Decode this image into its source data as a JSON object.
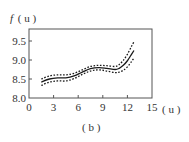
{
  "chart_data": {
    "type": "line",
    "title": "",
    "caption": "( b )",
    "ylabel_func": "f",
    "ylabel_arg": "( u )",
    "xlabel": "( u )",
    "xlim": [
      0,
      15
    ],
    "ylim": [
      8.0,
      9.75
    ],
    "xticks": [
      0,
      3,
      6,
      9,
      12,
      15
    ],
    "xtick_labels": [
      "0",
      "3",
      "6",
      "9",
      "12",
      "15"
    ],
    "yticks": [
      8.0,
      8.5,
      9.0,
      9.5
    ],
    "ytick_labels": [
      "8.0",
      "8.5",
      "9.0",
      "9.5"
    ],
    "grid": false,
    "legend": "none",
    "series": [
      {
        "name": "estimate",
        "style": "solid",
        "x": [
          1.5,
          2.5,
          3.5,
          4.5,
          5.5,
          6.5,
          7.5,
          8.5,
          9.5,
          10.5,
          11.0,
          11.5,
          12.0,
          12.5,
          12.8
        ],
        "y": [
          8.42,
          8.5,
          8.53,
          8.53,
          8.58,
          8.68,
          8.77,
          8.8,
          8.78,
          8.75,
          8.78,
          8.86,
          8.98,
          9.15,
          9.25
        ]
      },
      {
        "name": "upper-band",
        "style": "dashed",
        "x": [
          1.5,
          2.5,
          3.5,
          4.5,
          5.5,
          6.5,
          7.5,
          8.5,
          9.5,
          10.5,
          11.0,
          11.5,
          12.0,
          12.5,
          12.8
        ],
        "y": [
          8.5,
          8.58,
          8.61,
          8.61,
          8.65,
          8.74,
          8.83,
          8.86,
          8.85,
          8.83,
          8.88,
          8.99,
          9.15,
          9.36,
          9.48
        ]
      },
      {
        "name": "lower-band",
        "style": "dashed",
        "x": [
          1.5,
          2.5,
          3.5,
          4.5,
          5.5,
          6.5,
          7.5,
          8.5,
          9.5,
          10.5,
          11.0,
          11.5,
          12.0,
          12.5,
          12.8
        ],
        "y": [
          8.33,
          8.42,
          8.45,
          8.45,
          8.51,
          8.62,
          8.71,
          8.74,
          8.71,
          8.67,
          8.68,
          8.73,
          8.82,
          8.96,
          9.05
        ]
      }
    ]
  },
  "colors": {
    "line": "#1a1a1a",
    "frame": "#555555",
    "text": "#333333"
  }
}
